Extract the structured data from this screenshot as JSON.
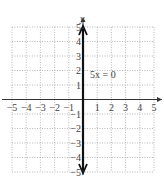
{
  "chart_data": {
    "type": "line",
    "title": "",
    "equation_label": "5x = 0",
    "xlabel": "",
    "ylabel": "y",
    "xlim": [
      -5,
      5
    ],
    "ylim": [
      -5,
      5
    ],
    "grid": true,
    "grid_style": "dotted",
    "x_ticks": [
      "-5",
      "-4",
      "-3",
      "-2",
      "-1",
      "1",
      "2",
      "3",
      "4",
      "5"
    ],
    "y_ticks": [
      "5",
      "4",
      "3",
      "2",
      "1",
      "-1",
      "-2",
      "-3",
      "-4",
      "-5"
    ],
    "series": [
      {
        "name": "5x = 0",
        "description": "vertical line x = 0 with arrows at both ends",
        "x": [
          0,
          0
        ],
        "y": [
          -5,
          5
        ]
      }
    ]
  },
  "labels": {
    "y_axis": "y",
    "equation": "5x = 0"
  },
  "colors": {
    "grid": "#9a9a9a",
    "axis": "#333333",
    "line": "#111111",
    "text": "#444444"
  }
}
